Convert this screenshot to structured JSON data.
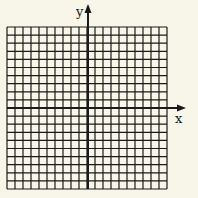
{
  "diagram": {
    "type": "coordinate-grid",
    "axes": {
      "x_label": "x",
      "y_label": "y"
    },
    "grid": {
      "columns": 20,
      "rows": 20,
      "origin_col": 10,
      "origin_row": 10
    },
    "colors": {
      "background": "#f8f6e9",
      "lines": "#1a1a1a"
    }
  }
}
